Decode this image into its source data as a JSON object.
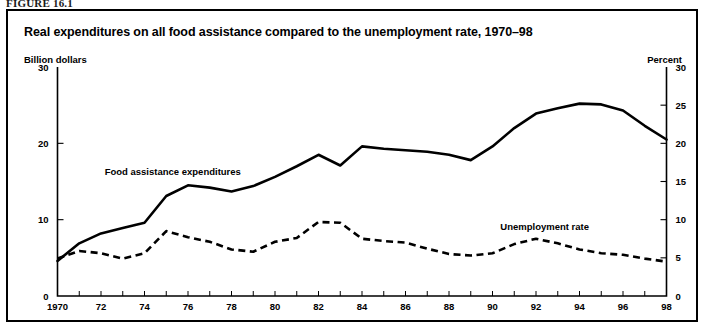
{
  "figure": {
    "tag": "FIGURE 16.1"
  },
  "chart_data": {
    "type": "line",
    "title": "Real expenditures on all food assistance compared to the unemployment rate, 1970–98",
    "xlabel": "",
    "ylabel": "Billion dollars",
    "y2label": "Percent",
    "ylim": [
      0,
      30
    ],
    "y2lim": [
      0,
      30
    ],
    "xlim": [
      1970,
      1998
    ],
    "grid": false,
    "legend_position": "inline-annotations",
    "y_ticks": [
      0,
      10,
      20,
      30
    ],
    "y2_ticks": [
      0,
      5,
      10,
      15,
      20,
      25,
      30
    ],
    "y_tick_labels": [
      "0",
      "10",
      "20",
      "30"
    ],
    "y2_tick_labels": [
      "0",
      "5",
      "10",
      "15",
      "20",
      "25",
      "30"
    ],
    "x_ticks": [
      1970,
      1971,
      1972,
      1973,
      1974,
      1975,
      1976,
      1977,
      1978,
      1979,
      1980,
      1981,
      1982,
      1983,
      1984,
      1985,
      1986,
      1987,
      1988,
      1989,
      1990,
      1991,
      1992,
      1993,
      1994,
      1995,
      1996,
      1997,
      1998
    ],
    "x_tick_labels": [
      "1970",
      "",
      "72",
      "",
      "74",
      "",
      "76",
      "",
      "78",
      "",
      "80",
      "",
      "82",
      "",
      "84",
      "",
      "86",
      "",
      "88",
      "",
      "90",
      "",
      "92",
      "",
      "94",
      "",
      "96",
      "",
      "98"
    ],
    "x": [
      1970,
      1971,
      1972,
      1973,
      1974,
      1975,
      1976,
      1977,
      1978,
      1979,
      1980,
      1981,
      1982,
      1983,
      1984,
      1985,
      1986,
      1987,
      1988,
      1989,
      1990,
      1991,
      1992,
      1993,
      1994,
      1995,
      1996,
      1997,
      1998
    ],
    "series": [
      {
        "name": "Food assistance expenditures",
        "style": "solid",
        "axis": "left",
        "units": "Billion dollars",
        "label_text": "Food assistance expenditures",
        "values": [
          4.6,
          6.9,
          8.2,
          8.9,
          9.6,
          13.1,
          14.5,
          14.2,
          13.7,
          14.4,
          15.6,
          17.0,
          18.5,
          17.1,
          19.6,
          19.3,
          19.1,
          18.9,
          18.5,
          17.8,
          19.6,
          22.0,
          23.9,
          24.6,
          25.2,
          25.1,
          24.3,
          22.3,
          20.5
        ]
      },
      {
        "name": "Unemployment rate",
        "style": "dashed",
        "axis": "right",
        "units": "Percent",
        "label_text": "Unemployment rate",
        "values": [
          4.9,
          5.9,
          5.6,
          4.9,
          5.6,
          8.5,
          7.7,
          7.1,
          6.1,
          5.8,
          7.1,
          7.6,
          9.7,
          9.6,
          7.5,
          7.2,
          7.0,
          6.2,
          5.5,
          5.3,
          5.6,
          6.8,
          7.5,
          6.9,
          6.1,
          5.6,
          5.4,
          4.9,
          4.5
        ]
      }
    ],
    "annotations": [
      {
        "text": "Food assistance expenditures",
        "x": 1975.3,
        "y": 15.8,
        "axis": "left"
      },
      {
        "text": "Unemployment rate",
        "x": 1992.4,
        "y": 8.6,
        "axis": "right"
      }
    ]
  }
}
